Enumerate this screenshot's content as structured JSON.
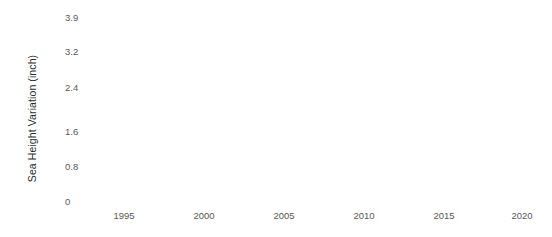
{
  "chart_data": {
    "type": "line",
    "title": "",
    "subtitle": "",
    "xlabel": "",
    "ylabel": "Sea Height Variation (inch)",
    "x": [],
    "values": [],
    "series": [],
    "xtick_labels": [
      "1995",
      "2000",
      "2005",
      "2010",
      "2015",
      "2020"
    ],
    "xtick_values": [
      1995,
      2000,
      2005,
      2010,
      2015,
      2020
    ],
    "ytick_labels": [
      "3.9",
      "3.2",
      "2.4",
      "1.6",
      "0.8",
      "0"
    ],
    "ytick_values": [
      3.9,
      3.2,
      2.4,
      1.6,
      0.8,
      0
    ],
    "xlim": [
      1993,
      2021
    ],
    "ylim": [
      0,
      3.9
    ],
    "grid": false,
    "axis_lines": false,
    "tick_marks": false,
    "legend": null,
    "annotations": [],
    "plot_area_empty": true,
    "background_color": "#ffffff",
    "tick_label_color": "#595959",
    "axis_title_color": "#2b2b2b"
  },
  "axes": {
    "y_title": "Sea Height Variation (inch)",
    "x_title": "",
    "y_ticks": [
      {
        "label": "3.9",
        "top": 13
      },
      {
        "label": "3.2",
        "top": 47
      },
      {
        "label": "2.4",
        "top": 83
      },
      {
        "label": "1.6",
        "top": 127
      },
      {
        "label": "0.8",
        "top": 162
      },
      {
        "label": "0",
        "top": 197
      }
    ],
    "x_ticks": [
      {
        "label": "1995",
        "left": 124
      },
      {
        "label": "2000",
        "left": 204
      },
      {
        "label": "2005",
        "left": 284
      },
      {
        "label": "2010",
        "left": 364
      },
      {
        "label": "2015",
        "left": 444
      },
      {
        "label": "2020",
        "left": 522
      }
    ]
  }
}
